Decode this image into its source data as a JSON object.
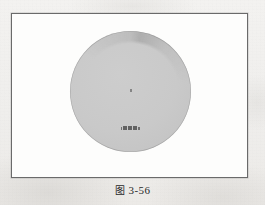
{
  "page": {
    "background_color": "#f1f0ee",
    "kind": "scanned-book-page"
  },
  "figure": {
    "frame": {
      "border_color": "#6a6a6a",
      "fill_color": "#fdfdfc"
    },
    "shape": {
      "kind": "circle",
      "fill_color": "#c9c9c9",
      "edge_color": "#bcbcbc",
      "center_mark": "·"
    },
    "inner_label": {
      "text": "",
      "note": "illegible small CJK glyph run",
      "glyph_count": 5
    }
  },
  "caption": {
    "mark": "图",
    "number": "3-56",
    "full": "图 3-56"
  }
}
